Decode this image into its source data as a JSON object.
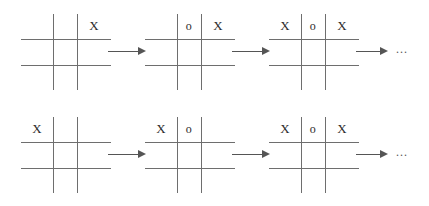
{
  "diagram": {
    "grid_size": 3,
    "mark_x": "X",
    "mark_o": "o",
    "empty": "",
    "arrow_glyph": "→",
    "ellipsis": "...",
    "line_color": "#6e6e6e",
    "mark_color": "#2b2b2b",
    "arrow_color": "#555555",
    "background_color": "#ffffff",
    "rows": [
      {
        "name": "sequence-row-1",
        "steps": [
          {
            "name": "board-1-1",
            "cells": [
              [
                "",
                "",
                "X"
              ],
              [
                "",
                "",
                ""
              ],
              [
                "",
                "",
                ""
              ]
            ]
          },
          {
            "name": "board-1-2",
            "cells": [
              [
                "",
                "o",
                "X"
              ],
              [
                "",
                "",
                ""
              ],
              [
                "",
                "",
                ""
              ]
            ]
          },
          {
            "name": "board-1-3",
            "cells": [
              [
                "X",
                "o",
                "X"
              ],
              [
                "",
                "",
                ""
              ],
              [
                "",
                "",
                ""
              ]
            ]
          }
        ],
        "trailing": "..."
      },
      {
        "name": "sequence-row-2",
        "steps": [
          {
            "name": "board-2-1",
            "cells": [
              [
                "X",
                "",
                ""
              ],
              [
                "",
                "",
                ""
              ],
              [
                "",
                "",
                ""
              ]
            ]
          },
          {
            "name": "board-2-2",
            "cells": [
              [
                "X",
                "o",
                ""
              ],
              [
                "",
                "",
                ""
              ],
              [
                "",
                "",
                ""
              ]
            ]
          },
          {
            "name": "board-2-3",
            "cells": [
              [
                "X",
                "o",
                "X"
              ],
              [
                "",
                "",
                ""
              ],
              [
                "",
                "",
                ""
              ]
            ]
          }
        ],
        "trailing": "..."
      }
    ]
  }
}
